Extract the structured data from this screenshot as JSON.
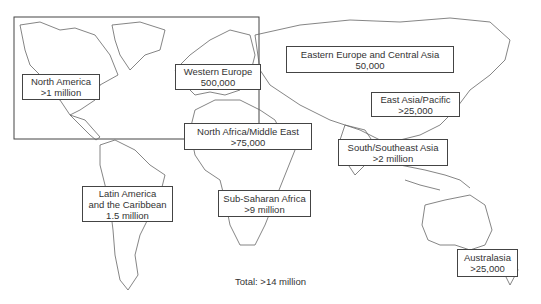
{
  "map": {
    "title": "",
    "total_label": "Total: >14 million",
    "regions": [
      {
        "id": "north-america",
        "name": "North America",
        "value": ">1 million"
      },
      {
        "id": "western-europe",
        "name": "Western Europe",
        "value": "500,000"
      },
      {
        "id": "eastern-europe-central-asia",
        "name": "Eastern Europe and Central Asia",
        "value": "50,000"
      },
      {
        "id": "east-asia-pacific",
        "name": "East Asia/Pacific",
        "value": ">25,000"
      },
      {
        "id": "north-africa-middle-east",
        "name": "North Africa/Middle East",
        "value": ">75,000"
      },
      {
        "id": "south-southeast-asia",
        "name": "South/Southeast Asia",
        "value": ">2 million"
      },
      {
        "id": "latin-america-caribbean",
        "name_line1": "Latin America",
        "name_line2": "and the Caribbean",
        "value": "1.5 million"
      },
      {
        "id": "sub-saharan-africa",
        "name": "Sub-Saharan Africa",
        "value": ">9 million"
      },
      {
        "id": "australasia",
        "name": "Australasia",
        "value": ">25,000"
      }
    ]
  }
}
